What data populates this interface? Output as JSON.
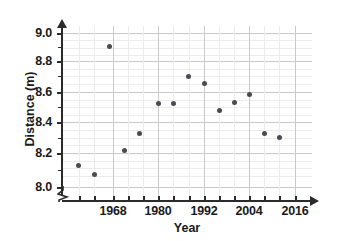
{
  "chart_data": {
    "type": "scatter",
    "title": "",
    "xlabel": "Year",
    "ylabel": "Distance (m)",
    "xlim": [
      1956,
      2020
    ],
    "ylim": [
      8.0,
      9.05
    ],
    "grid": true,
    "legend_position": "none",
    "x_ticks_labeled": [
      "1968",
      "1980",
      "1992",
      "2004",
      "2016"
    ],
    "x_tick_step_years": 4,
    "y_ticks_labeled": [
      "8.0",
      "8.2",
      "8.4",
      "8.6",
      "8.8",
      "9.0"
    ],
    "y_tick_step": 0.05,
    "y_axis_break": true,
    "point_color": "#4b4b55",
    "axis_color": "#2b2b2b",
    "gridline_color": "#d8d8d8",
    "x": [
      1959,
      1963,
      1967,
      1971,
      1975,
      1980,
      1984,
      1988,
      1992,
      1996,
      2000,
      2004,
      2008,
      2012
    ],
    "y": [
      8.14,
      8.08,
      8.91,
      8.24,
      8.35,
      8.54,
      8.54,
      8.72,
      8.67,
      8.5,
      8.55,
      8.6,
      8.35,
      8.32
    ],
    "points": [
      {
        "year": 1959,
        "distance": 8.14
      },
      {
        "year": 1963,
        "distance": 8.08
      },
      {
        "year": 1967,
        "distance": 8.91
      },
      {
        "year": 1971,
        "distance": 8.24
      },
      {
        "year": 1975,
        "distance": 8.35
      },
      {
        "year": 1980,
        "distance": 8.54
      },
      {
        "year": 1984,
        "distance": 8.54
      },
      {
        "year": 1988,
        "distance": 8.72
      },
      {
        "year": 1992,
        "distance": 8.67
      },
      {
        "year": 1996,
        "distance": 8.5
      },
      {
        "year": 2000,
        "distance": 8.55
      },
      {
        "year": 2004,
        "distance": 8.6
      },
      {
        "year": 2008,
        "distance": 8.35
      },
      {
        "year": 2012,
        "distance": 8.32
      }
    ]
  },
  "axes": {
    "x_title": "Year",
    "y_title": "Distance (m)",
    "y_tick_labels": [
      "9.0",
      "8.8",
      "8.6",
      "8.4",
      "8.2",
      "8.0"
    ],
    "x_tick_labels": [
      "1968",
      "1980",
      "1992",
      "2004",
      "2016"
    ]
  },
  "truncated_title": ""
}
